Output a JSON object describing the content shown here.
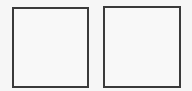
{
  "canvas": {
    "background": "#f6f6f6",
    "boxes": [
      {
        "id": "left-square",
        "label": "",
        "border_color": "#3a3a3a",
        "fill": "#f8f8f8"
      },
      {
        "id": "right-square",
        "label": "",
        "border_color": "#3a3a3a",
        "fill": "#f8f8f8"
      }
    ]
  }
}
